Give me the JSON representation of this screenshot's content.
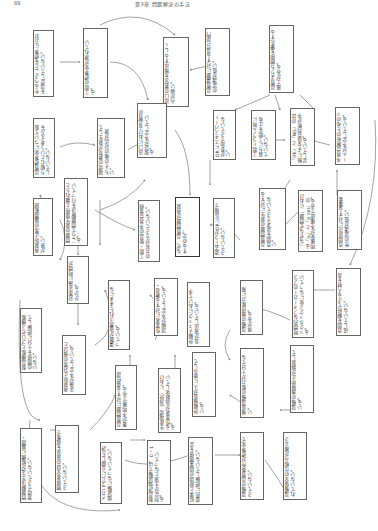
{
  "page": {
    "page_number": "88",
    "running_head": "第3章 問題解決の手法"
  },
  "diagram": {
    "type": "relation-diagram",
    "orientation": "rotated-90",
    "core_problem": "なぜ、品質問題が再発するのか？",
    "nodes": [
      {
        "id": "n1",
        "text": "やるべきことを標準に方針を設定していない。"
      },
      {
        "id": "n2",
        "text": "工程の標準化が遅れている。"
      },
      {
        "id": "n3",
        "text": "出口の異常を検出する しくみが弱い。"
      },
      {
        "id": "n4",
        "text": "品質課題に対する設計 部門の認識が低い。"
      },
      {
        "id": "n5",
        "text": "品質よりも納期を優先する風土がある。"
      },
      {
        "id": "n6",
        "text": "品質標準化について取り組むという考え方をしていない。"
      },
      {
        "id": "n7",
        "text": "現場の異常が発生しても その後の対応が遅い。"
      },
      {
        "id": "n8",
        "text": "出口における品質の保証が不足している。"
      },
      {
        "id": "n9",
        "text": "DRにエキスパートが参加できていない。"
      },
      {
        "id": "n10",
        "text": "工程トラブル時に直ちに工程を止めていない。"
      },
      {
        "id": "n11",
        "text": "「OK」と「NG」の比較による良否判断が不足している。"
      },
      {
        "id": "n12",
        "text": "不具合解析のためのツールが不足している。"
      },
      {
        "id": "n13",
        "text": "問題の発生箇所と離れたところで問題解決を行っている。"
      },
      {
        "id": "n14",
        "text": "工程・製品の不具合事例の共有ができていない。"
      },
      {
        "id": "n15",
        "text": "過去トラがDRに反映できていない。"
      },
      {
        "id": "n16",
        "text": "品質問題の発生に対する真因を追求できていない。"
      },
      {
        "id": "n17",
        "text": "「なぜなぜ問題」における「is」と「is not」の明確化が不徹底である。"
      },
      {
        "id": "n18",
        "text": "真因追究に対する重要性の認識が低い。"
      },
      {
        "id": "n19",
        "text": "再発防止策の展開範囲が狭い。"
      },
      {
        "id": "n20",
        "text": "対策実施に時間がかかる。"
      },
      {
        "id": "n21",
        "text": "課題が放置されたままになっている。"
      },
      {
        "id": "n22",
        "text": "作業者に対する教育・訓練が不足している。"
      },
      {
        "id": "n23",
        "text": "外観チェックにおいて不良が流出している。"
      },
      {
        "id": "n24",
        "text": "設備の維持能力に限界がある。"
      },
      {
        "id": "n25",
        "text": "時間的なフォーカーのブラックボックス化になっている。"
      },
      {
        "id": "n26",
        "text": "真因を解析できる人材を育成していない。"
      },
      {
        "id": "n27",
        "text": "製品機能とプロセス機能の関係を十分に把握していない。"
      },
      {
        "id": "n28",
        "text": "再発防止対策の検討と実施が不足している。"
      },
      {
        "id": "n29",
        "text": "品質問題に対する責任部署が不明確である。"
      },
      {
        "id": "n30",
        "text": "生産現場（海外）における作業者が高齢化している。"
      },
      {
        "id": "n31",
        "text": "外観検査が人に依存している。"
      },
      {
        "id": "n32",
        "text": "検査設備の能力が十分でない。"
      },
      {
        "id": "n33",
        "text": "設備の故障停止が頻発している。"
      },
      {
        "id": "n34",
        "text": "問題解決手法が組織に展開・習得できていない。"
      },
      {
        "id": "n35",
        "text": "関係者全員の意見を収集できていない。"
      },
      {
        "id": "n36",
        "text": "メカニズムに立脚した評価試験になっていない。"
      },
      {
        "id": "n37",
        "text": "製品評価試験では、0・1判定が主流となっている。"
      },
      {
        "id": "n38",
        "text": "結果と原因の因果関係を定量的に把握していない。"
      },
      {
        "id": "n39",
        "text": "設備の品質条件が標準化できていない。"
      },
      {
        "id": "n40",
        "text": "設備保全の仕組みが確立されていない。"
      }
    ]
  }
}
